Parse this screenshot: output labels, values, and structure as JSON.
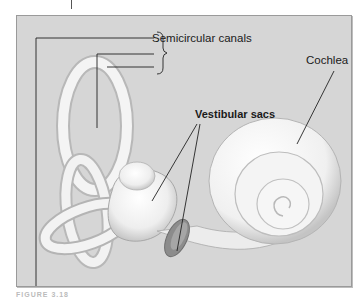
{
  "figure": {
    "labels": {
      "semicircular_canals": "Semicircular canals",
      "cochlea": "Cochlea",
      "vestibular_sacs": "Vestibular sacs"
    },
    "caption": "FIGURE 3.18"
  },
  "colors": {
    "background": "#d6d6d6",
    "frame_border": "#9a9a9a",
    "leader_lines": "#222222",
    "organ_fill": "#f2f2f2"
  }
}
